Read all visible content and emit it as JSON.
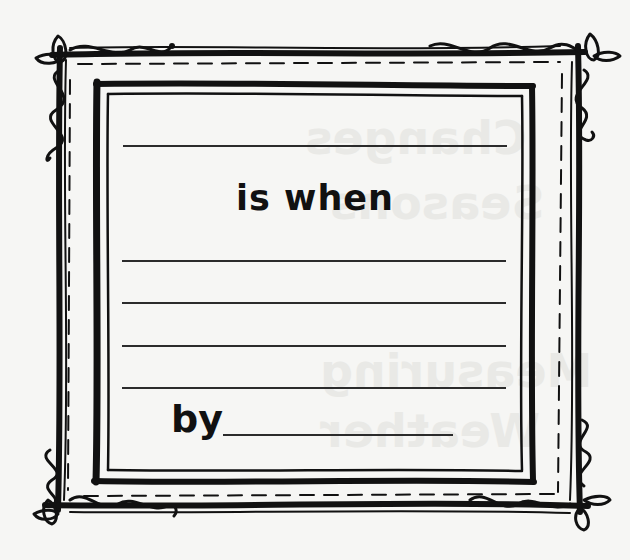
{
  "worksheet": {
    "prompt_connector": "is when",
    "author_label": "by",
    "blank_lines": {
      "top_count": 1,
      "middle_count": 4,
      "author_line": 1
    }
  },
  "bleed_through": {
    "lines": [
      "Changes",
      "Seasons",
      "Measuring",
      "Weather"
    ]
  },
  "colors": {
    "paper": "#f6f6f4",
    "ink": "#111111",
    "rule": "#2b2b2b",
    "bleed": "#e9e9e6"
  }
}
